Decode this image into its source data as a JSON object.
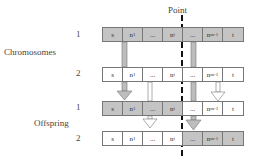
{
  "diagram": {
    "title_point": "Point",
    "groups": [
      {
        "label": "Chromosomes",
        "rows": [
          {
            "index": "1",
            "cells": [
              {
                "text": "s",
                "fill": "gray"
              },
              {
                "text": "n",
                "sub": "1",
                "fill": "gray"
              },
              {
                "text": "...",
                "fill": "gray"
              },
              {
                "text": "n",
                "sub": "i",
                "fill": "gray"
              },
              {
                "text": "...",
                "fill": "gray"
              },
              {
                "text": "n",
                "sub": "m-1",
                "fill": "gray"
              },
              {
                "text": "t",
                "fill": "gray"
              }
            ]
          },
          {
            "index": "2",
            "cells": [
              {
                "text": "s",
                "fill": "white"
              },
              {
                "text": "n",
                "sub": "1",
                "fill": "white"
              },
              {
                "text": "...",
                "fill": "white"
              },
              {
                "text": "n",
                "sub": "i",
                "fill": "white"
              },
              {
                "text": "...",
                "fill": "white"
              },
              {
                "text": "n",
                "sub": "m-1",
                "fill": "white"
              },
              {
                "text": "t",
                "fill": "white"
              }
            ]
          }
        ]
      },
      {
        "label": "Offspring",
        "rows": [
          {
            "index": "1",
            "cells": [
              {
                "text": "s",
                "fill": "gray"
              },
              {
                "text": "n",
                "sub": "1",
                "fill": "gray"
              },
              {
                "text": "...",
                "fill": "gray"
              },
              {
                "text": "n",
                "sub": "i",
                "fill": "gray"
              },
              {
                "text": "...",
                "fill": "white"
              },
              {
                "text": "n",
                "sub": "m-1",
                "fill": "white"
              },
              {
                "text": "t",
                "fill": "white"
              }
            ]
          },
          {
            "index": "2",
            "cells": [
              {
                "text": "s",
                "fill": "white"
              },
              {
                "text": "n",
                "sub": "1",
                "fill": "white"
              },
              {
                "text": "...",
                "fill": "white"
              },
              {
                "text": "n",
                "sub": "i",
                "fill": "white"
              },
              {
                "text": "...",
                "fill": "gray"
              },
              {
                "text": "n",
                "sub": "m-1",
                "fill": "gray"
              },
              {
                "text": "t",
                "fill": "gray"
              }
            ]
          }
        ]
      }
    ],
    "colors": {
      "gray": "#c4c4c4",
      "white": "#ffffff",
      "border": "#777777",
      "dash": "#111111"
    }
  }
}
